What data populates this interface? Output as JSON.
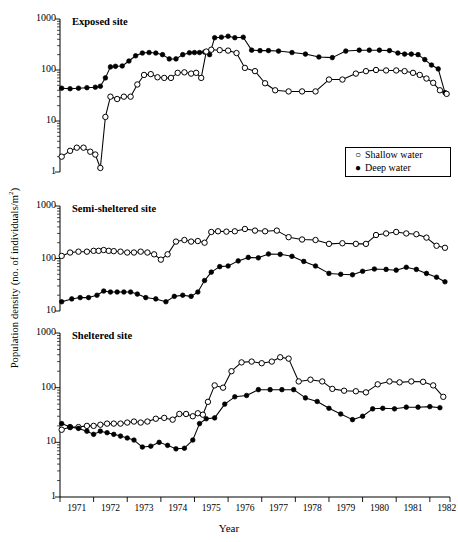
{
  "figure": {
    "ylabel_main": "Population density (no. of individuals/m",
    "ylabel_sup": "2",
    "ylabel_tail": ")",
    "xlabel": "Year",
    "legend": {
      "shallow_glyph": "○",
      "shallow_label": "Shallow water",
      "deep_glyph": "●",
      "deep_label": "Deep water"
    },
    "panels": [
      {
        "title": "Exposed site",
        "yticks": [
          "1000",
          "100",
          "10",
          "1"
        ]
      },
      {
        "title": "Semi-sheltered site",
        "yticks": [
          "1000",
          "100",
          "10"
        ]
      },
      {
        "title": "Sheltered site",
        "yticks": [
          "1000",
          "100",
          "10",
          "1"
        ]
      }
    ],
    "xticks": [
      "1971",
      "1972",
      "1973",
      "1974",
      "1975",
      "1976",
      "1977",
      "1978",
      "1979",
      "1980",
      "1981",
      "1982"
    ]
  },
  "chart_data": [
    {
      "type": "line",
      "title": "Exposed site",
      "xlabel": "Year",
      "ylabel": "Population density (no. of individuals/m2)",
      "yscale": "log",
      "ylim": [
        1,
        1000
      ],
      "xlim": [
        1971.0,
        1982.6
      ],
      "grid": false,
      "legend_position": "middle-right",
      "series": [
        {
          "name": "Deep water",
          "marker": "filled-circle",
          "x": [
            1971.05,
            1971.3,
            1971.55,
            1971.8,
            1972.05,
            1972.2,
            1972.35,
            1972.5,
            1972.65,
            1972.85,
            1973.05,
            1973.25,
            1973.45,
            1973.65,
            1973.85,
            1974.05,
            1974.25,
            1974.45,
            1974.65,
            1974.85,
            1975.0,
            1975.15,
            1975.3,
            1975.45,
            1975.6,
            1975.8,
            1976.0,
            1976.2,
            1976.45,
            1976.7,
            1976.95,
            1977.2,
            1977.5,
            1977.9,
            1978.3,
            1978.7,
            1979.1,
            1979.5,
            1979.9,
            1980.2,
            1980.5,
            1980.8,
            1981.05,
            1981.25,
            1981.45,
            1981.65,
            1981.85,
            1982.05,
            1982.25,
            1982.45
          ],
          "y": [
            44,
            43,
            44,
            45,
            46,
            48,
            70,
            115,
            118,
            120,
            150,
            190,
            215,
            220,
            215,
            200,
            165,
            165,
            200,
            218,
            220,
            220,
            225,
            200,
            430,
            440,
            460,
            430,
            440,
            245,
            240,
            240,
            235,
            220,
            205,
            180,
            175,
            235,
            245,
            245,
            245,
            240,
            215,
            205,
            205,
            200,
            160,
            125,
            105,
            36
          ]
        },
        {
          "name": "Shallow water",
          "marker": "open-circle",
          "x": [
            1971.05,
            1971.3,
            1971.5,
            1971.7,
            1971.9,
            1972.05,
            1972.2,
            1972.35,
            1972.5,
            1972.7,
            1972.9,
            1973.1,
            1973.3,
            1973.5,
            1973.7,
            1973.9,
            1974.1,
            1974.3,
            1974.5,
            1974.7,
            1974.9,
            1975.05,
            1975.2,
            1975.35,
            1975.5,
            1975.75,
            1976.0,
            1976.25,
            1976.5,
            1976.8,
            1977.1,
            1977.4,
            1977.8,
            1978.2,
            1978.6,
            1979.0,
            1979.4,
            1979.8,
            1980.1,
            1980.4,
            1980.7,
            1981.0,
            1981.25,
            1981.5,
            1981.7,
            1981.9,
            1982.1,
            1982.3,
            1982.5
          ],
          "y": [
            2.0,
            2.6,
            3.0,
            3.0,
            2.5,
            2.2,
            1.2,
            12,
            30,
            27,
            30,
            30,
            52,
            80,
            83,
            72,
            70,
            70,
            88,
            90,
            85,
            88,
            70,
            230,
            250,
            245,
            240,
            215,
            110,
            95,
            55,
            40,
            38,
            38,
            38,
            65,
            65,
            85,
            95,
            100,
            98,
            98,
            95,
            88,
            80,
            68,
            56,
            40,
            34
          ]
        }
      ]
    },
    {
      "type": "line",
      "title": "Semi-sheltered site",
      "xlabel": "Year",
      "ylabel": "Population density (no. of individuals/m2)",
      "yscale": "log",
      "ylim": [
        10,
        1000
      ],
      "xlim": [
        1971.0,
        1982.6
      ],
      "grid": false,
      "series": [
        {
          "name": "Shallow water",
          "marker": "open-circle",
          "x": [
            1971.05,
            1971.3,
            1971.55,
            1971.8,
            1972.0,
            1972.15,
            1972.3,
            1972.45,
            1972.6,
            1972.8,
            1973.0,
            1973.2,
            1973.4,
            1973.6,
            1973.8,
            1974.0,
            1974.2,
            1974.45,
            1974.7,
            1974.9,
            1975.1,
            1975.3,
            1975.5,
            1975.7,
            1975.95,
            1976.2,
            1976.5,
            1976.8,
            1977.1,
            1977.45,
            1977.8,
            1978.2,
            1978.6,
            1979.0,
            1979.4,
            1979.8,
            1980.1,
            1980.4,
            1980.7,
            1981.0,
            1981.3,
            1981.6,
            1981.9,
            1982.2,
            1982.45
          ],
          "y": [
            112,
            130,
            135,
            135,
            140,
            140,
            145,
            140,
            138,
            135,
            130,
            130,
            135,
            130,
            120,
            95,
            120,
            210,
            225,
            210,
            215,
            200,
            320,
            330,
            325,
            330,
            365,
            340,
            330,
            340,
            255,
            230,
            225,
            190,
            195,
            190,
            190,
            280,
            300,
            320,
            300,
            290,
            250,
            175,
            160
          ]
        },
        {
          "name": "Deep water",
          "marker": "filled-circle",
          "x": [
            1971.05,
            1971.35,
            1971.6,
            1971.85,
            1972.1,
            1972.3,
            1972.5,
            1972.7,
            1972.9,
            1973.1,
            1973.3,
            1973.55,
            1973.85,
            1974.15,
            1974.4,
            1974.65,
            1974.9,
            1975.1,
            1975.3,
            1975.5,
            1975.75,
            1976.0,
            1976.3,
            1976.6,
            1976.9,
            1977.2,
            1977.55,
            1977.9,
            1978.25,
            1978.6,
            1979.0,
            1979.35,
            1979.7,
            1980.0,
            1980.35,
            1980.7,
            1981.0,
            1981.3,
            1981.6,
            1981.9,
            1982.2,
            1982.45
          ],
          "y": [
            15,
            17,
            18,
            18,
            20,
            24,
            23,
            23,
            23,
            23,
            21,
            18,
            17,
            15,
            19,
            20,
            19,
            23,
            38,
            55,
            70,
            72,
            90,
            105,
            103,
            122,
            120,
            110,
            88,
            72,
            52,
            50,
            49,
            57,
            63,
            62,
            60,
            68,
            62,
            52,
            44,
            36
          ]
        }
      ]
    },
    {
      "type": "line",
      "title": "Sheltered site",
      "xlabel": "Year",
      "ylabel": "Population density (no. of individuals/m2)",
      "yscale": "log",
      "ylim": [
        1,
        1000
      ],
      "xlim": [
        1971.0,
        1982.6
      ],
      "grid": false,
      "series": [
        {
          "name": "Shallow water",
          "marker": "open-circle",
          "x": [
            1971.05,
            1971.3,
            1971.55,
            1971.8,
            1972.0,
            1972.2,
            1972.4,
            1972.6,
            1972.8,
            1973.0,
            1973.2,
            1973.4,
            1973.6,
            1973.85,
            1974.1,
            1974.35,
            1974.55,
            1974.75,
            1974.95,
            1975.1,
            1975.25,
            1975.4,
            1975.6,
            1975.85,
            1976.1,
            1976.4,
            1976.7,
            1977.0,
            1977.3,
            1977.55,
            1977.8,
            1978.1,
            1978.45,
            1978.8,
            1979.1,
            1979.45,
            1979.8,
            1980.1,
            1980.45,
            1980.8,
            1981.1,
            1981.45,
            1981.8,
            1982.1,
            1982.4
          ],
          "y": [
            17,
            19,
            19,
            20,
            20,
            21,
            22,
            22,
            22,
            23,
            24,
            23,
            24,
            27,
            28,
            26,
            33,
            33,
            30,
            34,
            32,
            55,
            110,
            100,
            200,
            290,
            300,
            280,
            300,
            360,
            340,
            130,
            140,
            130,
            95,
            88,
            86,
            82,
            115,
            130,
            125,
            130,
            128,
            110,
            68
          ]
        },
        {
          "name": "Deep water",
          "marker": "filled-circle",
          "x": [
            1971.05,
            1971.3,
            1971.55,
            1971.8,
            1972.0,
            1972.2,
            1972.4,
            1972.6,
            1972.8,
            1973.0,
            1973.2,
            1973.45,
            1973.7,
            1973.95,
            1974.2,
            1974.45,
            1974.7,
            1974.95,
            1975.15,
            1975.35,
            1975.6,
            1975.9,
            1976.2,
            1976.55,
            1976.9,
            1977.25,
            1977.6,
            1977.95,
            1978.3,
            1978.65,
            1979.0,
            1979.35,
            1979.7,
            1980.0,
            1980.3,
            1980.6,
            1980.95,
            1981.3,
            1981.65,
            1982.0,
            1982.3
          ],
          "y": [
            22,
            19,
            18,
            16,
            14,
            16,
            15,
            14,
            13,
            12,
            11,
            8.2,
            8.5,
            10,
            8.8,
            7.6,
            7.8,
            11,
            22,
            27,
            28,
            50,
            68,
            72,
            92,
            92,
            92,
            92,
            65,
            56,
            42,
            33,
            26,
            30,
            41,
            42,
            41,
            44,
            44,
            45,
            43
          ]
        }
      ]
    }
  ]
}
